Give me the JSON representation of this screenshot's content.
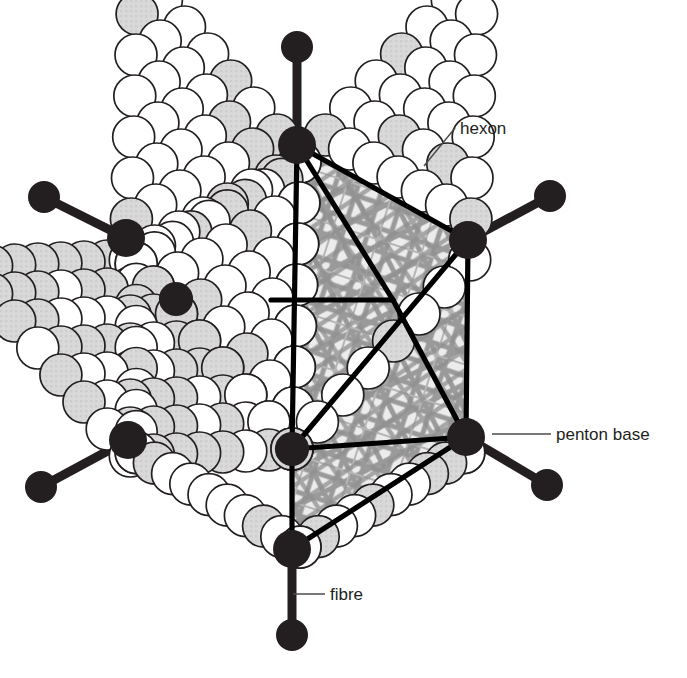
{
  "figure": {
    "background_color": "#ffffff",
    "width": 687,
    "height": 678
  },
  "labels": [
    {
      "id": "hexon",
      "text": "hexon",
      "text_x": 460,
      "text_y": 134,
      "anchor": "start",
      "leader": [
        [
          455,
          128
        ],
        [
          424,
          166
        ]
      ]
    },
    {
      "id": "penton-base",
      "text": "penton base",
      "text_x": 556,
      "text_y": 440,
      "anchor": "start",
      "leader": [
        [
          551,
          434
        ],
        [
          492,
          434
        ]
      ]
    },
    {
      "id": "fibre",
      "text": "fibre",
      "text_x": 330,
      "text_y": 600,
      "anchor": "start",
      "leader": [
        [
          325,
          594
        ],
        [
          293,
          594
        ]
      ]
    }
  ],
  "colors": {
    "ink": "#231f20",
    "capsomer_fill_light": "#ffffff",
    "capsomer_fill_shaded": "#d9d9d9",
    "capsomer_stroke": "#231f20",
    "core_fill": "#e8e8e8",
    "core_strand": "#8c8c8c",
    "penton_fill": "#231f20",
    "fibre_stroke": "#231f20",
    "edge_line": "#000000",
    "leader_line": "#4d4d4d"
  },
  "geometry": {
    "capsid_center": [
      300,
      358
    ],
    "capsid_radius": 196,
    "capsomer_radius": 21,
    "penton_radius": 19,
    "fibre_knob_radius": 16,
    "fibre_width": 9,
    "vertices": [
      {
        "id": "vertex-top",
        "x": 297,
        "y": 145,
        "knob_x": 297,
        "knob_y": 47,
        "has_fibre": true
      },
      {
        "id": "vertex-upper-right",
        "x": 468,
        "y": 240,
        "knob_x": 550,
        "knob_y": 196,
        "has_fibre": true
      },
      {
        "id": "vertex-lower-right",
        "x": 466,
        "y": 437,
        "knob_x": 547,
        "knob_y": 485,
        "has_fibre": true
      },
      {
        "id": "vertex-bottom",
        "x": 292,
        "y": 549,
        "knob_x": 292,
        "knob_y": 635,
        "has_fibre": true
      },
      {
        "id": "vertex-lower-left",
        "x": 128,
        "y": 440,
        "knob_x": 41,
        "knob_y": 487,
        "has_fibre": true
      },
      {
        "id": "vertex-upper-left",
        "x": 126,
        "y": 238,
        "knob_x": 44,
        "knob_y": 197,
        "has_fibre": true
      },
      {
        "id": "vertex-front",
        "x": 292,
        "y": 449,
        "knob_x": 292,
        "knob_y": 449,
        "has_fibre": false
      },
      {
        "id": "vertex-interior",
        "x": 176,
        "y": 299,
        "knob_x": 176,
        "knob_y": 299,
        "has_fibre": false
      }
    ],
    "facet_edges": [
      [
        297,
        145,
        468,
        240
      ],
      [
        297,
        145,
        292,
        449
      ],
      [
        468,
        240,
        292,
        449
      ],
      [
        468,
        240,
        466,
        437
      ],
      [
        292,
        449,
        466,
        437
      ],
      [
        292,
        449,
        292,
        549
      ],
      [
        292,
        549,
        466,
        437
      ],
      [
        297,
        145,
        393,
        300
      ],
      [
        393,
        300,
        466,
        437
      ],
      [
        271,
        300,
        393,
        300
      ]
    ]
  },
  "capsid": {
    "description": "Icosahedral protein shell drawn as packed spherical capsomers (hexons); twelve dark vertices are penton bases, each bearing a projecting fibre with a terminal knob.",
    "capsomer_count_visible": 168,
    "shaded_fraction": 0.33
  },
  "core": {
    "description": "Interior viral genome drawn as a tangle of interwoven grey strands."
  }
}
